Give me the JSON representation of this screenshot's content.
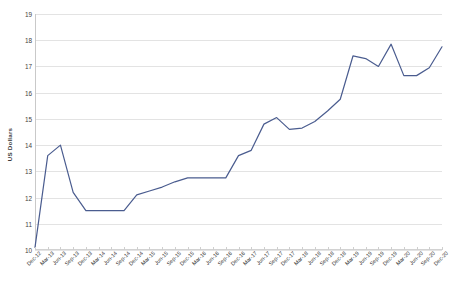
{
  "chart_data": {
    "type": "line",
    "title": "",
    "subtitle": "",
    "xlabel": "",
    "ylabel": "US Dollars",
    "ylim": [
      10,
      19
    ],
    "yticks": [
      10,
      11,
      12,
      13,
      14,
      15,
      16,
      17,
      18,
      19
    ],
    "grid": true,
    "legend": false,
    "legend_position": "none",
    "line_color": "#4a5c8f",
    "categories": [
      "Dec-12",
      "Mar-13",
      "Jun-13",
      "Sep-13",
      "Dec-13",
      "Mar-14",
      "Jun-14",
      "Sep-14",
      "Dec-14",
      "Mar-15",
      "Jun-15",
      "Sep-15",
      "Dec-15",
      "Mar-16",
      "Jun-16",
      "Sep-16",
      "Dec-16",
      "Mar-17",
      "Jun-17",
      "Sep-17",
      "Dec-17",
      "Mar-18",
      "Jun-18",
      "Sep-18",
      "Dec-18",
      "Mar-19",
      "Jun-19",
      "Sep-19",
      "Dec-19",
      "Mar-20",
      "Jun-20",
      "Sep-20",
      "Dec-20"
    ],
    "values": [
      10.1,
      13.6,
      14.0,
      12.2,
      11.5,
      11.5,
      11.5,
      11.5,
      12.1,
      12.25,
      12.4,
      12.6,
      12.75,
      12.75,
      12.75,
      12.75,
      13.6,
      13.8,
      14.8,
      15.05,
      14.6,
      14.65,
      14.9,
      15.3,
      15.75,
      17.4,
      17.3,
      17.0,
      17.85,
      16.65,
      16.65,
      16.95,
      17.75
    ],
    "series": [
      {
        "name": "US Dollars",
        "values": [
          10.1,
          13.6,
          14.0,
          12.2,
          11.5,
          11.5,
          11.5,
          11.5,
          12.1,
          12.25,
          12.4,
          12.6,
          12.75,
          12.75,
          12.75,
          12.75,
          13.6,
          13.8,
          14.8,
          15.05,
          14.6,
          14.65,
          14.9,
          15.3,
          15.75,
          17.4,
          17.3,
          17.0,
          17.85,
          16.65,
          16.65,
          16.95,
          17.75
        ]
      }
    ]
  }
}
